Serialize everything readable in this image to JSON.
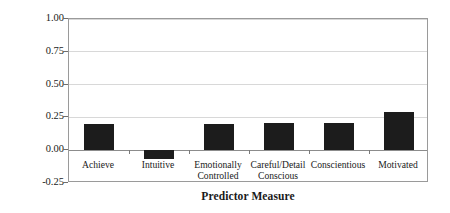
{
  "chart_data": {
    "type": "bar",
    "title": "",
    "xlabel": "Predictor Measure",
    "ylabel": "Correlation With Cognitive",
    "categories": [
      "Achieve",
      "Intuitive",
      "Emotionally\nControlled",
      "Careful/Detail\nConscious",
      "Conscientious",
      "Motivated"
    ],
    "values": [
      0.2,
      -0.07,
      0.2,
      0.21,
      0.21,
      0.29
    ],
    "ylim": [
      -0.25,
      1.0
    ],
    "yticks": [
      "1.00",
      "0.75",
      "0.50",
      "0.25",
      "0.00",
      "-0.25"
    ],
    "ytick_values": [
      1.0,
      0.75,
      0.5,
      0.25,
      0.0,
      -0.25
    ],
    "grid": true,
    "legend": "none",
    "bar_color": "#1c1c1c",
    "grid_color": "#d8d8d8",
    "frame_color": "#9a9a9a",
    "background": "#ffffff"
  }
}
